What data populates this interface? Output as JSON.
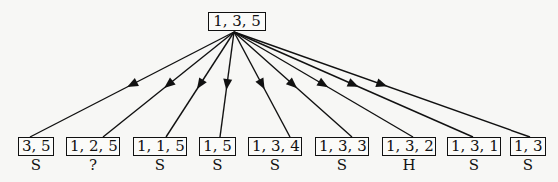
{
  "root": {
    "label": "1, 3, 5"
  },
  "children": [
    {
      "label": "3, 5",
      "status": "S"
    },
    {
      "label": "1, 2, 5",
      "status": "?"
    },
    {
      "label": "1, 1, 5",
      "status": "S"
    },
    {
      "label": "1, 5",
      "status": "S"
    },
    {
      "label": "1, 3, 4",
      "status": "S"
    },
    {
      "label": "1, 3, 3",
      "status": "S"
    },
    {
      "label": "1, 3, 2",
      "status": "H"
    },
    {
      "label": "1, 3, 1",
      "status": "S"
    },
    {
      "label": "1, 3",
      "status": "S"
    }
  ]
}
